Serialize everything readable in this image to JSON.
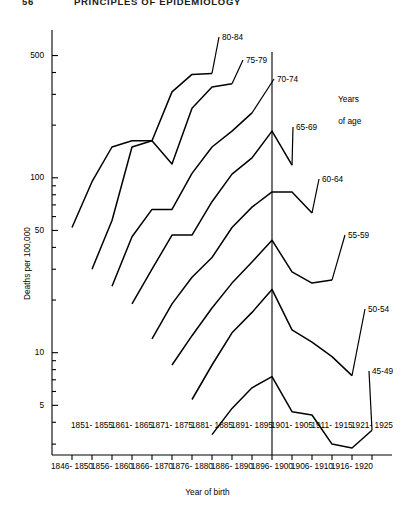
{
  "page": {
    "running_head_number": "56",
    "running_head_title": "PRINCIPLES OF EPIDEMIOLOGY"
  },
  "legend": {
    "title_line1": "Years",
    "title_line2": "of age"
  },
  "chart_data": {
    "type": "line",
    "title": "",
    "xlabel": "Year of birth",
    "ylabel": "Deaths per 100,000",
    "log_y": true,
    "ylim": [
      2.6,
      700
    ],
    "ytick_labels": [
      "500",
      "100",
      "50",
      "10",
      "5"
    ],
    "ytick_values": [
      500,
      100,
      50,
      10,
      5
    ],
    "yminor_values": [
      400,
      300,
      200,
      90,
      80,
      70,
      60,
      40,
      30,
      20,
      9,
      8,
      7,
      6,
      4,
      3
    ],
    "grid": false,
    "legend_position": "inline-right",
    "reference_line_category": "1896-1900",
    "categories_upper": [
      "1851-\n1855",
      "1861-\n1865",
      "1871-\n1875",
      "1881-\n1885",
      "1891-\n1895",
      "1901-\n1905",
      "1911-\n1915",
      "1921-\n1925"
    ],
    "categories_lower": [
      "1846-\n1850",
      "1856-\n1860",
      "1866-\n1870",
      "1876-\n1880",
      "1886-\n1890",
      "1896-\n1900",
      "1906-\n1910",
      "1916-\n1920"
    ],
    "x": [
      "1846-1850",
      "1851-1855",
      "1856-1860",
      "1861-1865",
      "1866-1870",
      "1871-1875",
      "1876-1880",
      "1881-1885",
      "1886-1890",
      "1891-1895",
      "1896-1900",
      "1901-1905",
      "1906-1910",
      "1911-1915",
      "1916-1920",
      "1921-1925"
    ],
    "series": [
      {
        "name": "80-84",
        "label": "80-84",
        "x": [
          "1846-1850",
          "1851-1855",
          "1856-1860",
          "1861-1865",
          "1866-1870",
          "1871-1875",
          "1876-1880",
          "1881-1885"
        ],
        "values": [
          52,
          95,
          150,
          163,
          163,
          310,
          390,
          395
        ]
      },
      {
        "name": "75-79",
        "label": "75-79",
        "x": [
          "1851-1855",
          "1856-1860",
          "1861-1865",
          "1866-1870",
          "1871-1875",
          "1876-1880",
          "1881-1885",
          "1886-1890"
        ],
        "values": [
          30,
          57,
          150,
          163,
          120,
          250,
          330,
          345
        ]
      },
      {
        "name": "70-74",
        "label": "70-74",
        "x": [
          "1856-1860",
          "1861-1865",
          "1866-1870",
          "1871-1875",
          "1876-1880",
          "1881-1885",
          "1886-1890",
          "1891-1895"
        ],
        "values": [
          24,
          46,
          66,
          66,
          106,
          150,
          185,
          235
        ]
      },
      {
        "name": "65-69",
        "label": "65-69",
        "x": [
          "1861-1865",
          "1866-1870",
          "1871-1875",
          "1876-1880",
          "1881-1885",
          "1886-1890",
          "1891-1895",
          "1896-1900",
          "1901-1905"
        ],
        "values": [
          19,
          30,
          47,
          47,
          73,
          105,
          130,
          185,
          118
        ]
      },
      {
        "name": "60-64",
        "label": "60-64",
        "x": [
          "1866-1870",
          "1871-1875",
          "1876-1880",
          "1881-1885",
          "1886-1890",
          "1891-1895",
          "1896-1900",
          "1901-1905",
          "1906-1910"
        ],
        "values": [
          12,
          19,
          27,
          35,
          52,
          68,
          83,
          83,
          63
        ]
      },
      {
        "name": "55-59",
        "label": "55-59",
        "x": [
          "1871-1875",
          "1876-1880",
          "1881-1885",
          "1886-1890",
          "1891-1895",
          "1896-1900",
          "1901-1905",
          "1906-1910",
          "1911-1915"
        ],
        "values": [
          8.5,
          12.5,
          18,
          25,
          33,
          44,
          29,
          25,
          26
        ]
      },
      {
        "name": "50-54",
        "label": "50-54",
        "x": [
          "1876-1880",
          "1881-1885",
          "1886-1890",
          "1891-1895",
          "1896-1900",
          "1901-1905",
          "1906-1910",
          "1911-1915",
          "1916-1920"
        ],
        "values": [
          5.4,
          8.5,
          13,
          17,
          23,
          13.5,
          11.5,
          9.5,
          7.4
        ]
      },
      {
        "name": "45-49",
        "label": "45-49",
        "x": [
          "1881-1885",
          "1886-1890",
          "1891-1895",
          "1896-1900",
          "1901-1905",
          "1906-1910",
          "1911-1915",
          "1916-1920",
          "1921-1925"
        ],
        "values": [
          3.4,
          4.8,
          6.3,
          7.3,
          4.6,
          4.4,
          3.0,
          2.85,
          3.6
        ]
      }
    ]
  }
}
